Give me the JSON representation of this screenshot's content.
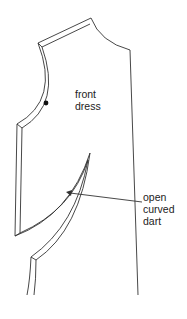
{
  "diagram": {
    "pattern_label": [
      "front",
      "dress"
    ],
    "callout_label": [
      "open",
      "curved",
      "dart"
    ],
    "colors": {
      "line": "#333333",
      "text": "#222222",
      "background": "#ffffff"
    }
  }
}
